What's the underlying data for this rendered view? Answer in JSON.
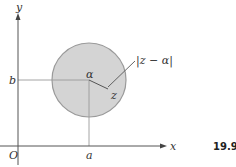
{
  "diagram": {
    "type": "complex-plane-disk",
    "axes": {
      "origin_label": "O",
      "x_label": "x",
      "y_label": "y",
      "x_tick_label": "a",
      "y_tick_label": "b"
    },
    "circle": {
      "center_label": "α",
      "point_label": "z",
      "radius_label": "|z − α|"
    },
    "figure_number": "19.9",
    "colors": {
      "disk_fill": "#d4d4d4",
      "disk_stroke": "#9a9a9a",
      "axis": "#555555",
      "guide_lines": "#9a9a9a"
    }
  }
}
